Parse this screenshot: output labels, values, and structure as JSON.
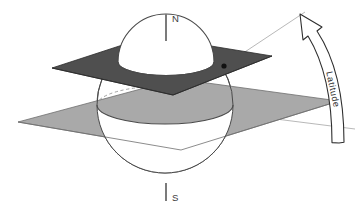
{
  "figure": {
    "background_color": "#ffffff"
  },
  "labels": {
    "north_pole": "N",
    "south_pole": "S",
    "latitude_arrow": "Latitude"
  },
  "colors": {
    "upper_plane": "#4f4f4f",
    "upper_plane_edge": "#2b2b2b",
    "lower_plane": "#a9a9a9",
    "lower_plane_edge": "#6f6f6f",
    "sphere_fill": "#ffffff",
    "sphere_outline": "#4a4a4a",
    "hidden_edge": "#8a8a8a",
    "axis": "#7b7b7b",
    "ray": "#9a9a9a",
    "point_marker": "#111111",
    "arrow_stroke": "#2e2e2e",
    "arrow_fill": "#ffffff"
  },
  "geometry": {
    "sphere_center": {
      "x": 165,
      "y": 105
    },
    "sphere_radius": 68,
    "equator_plane_y": 105,
    "latitude_plane_y": 62,
    "point_marker": {
      "x": 224,
      "y": 66
    },
    "axis_top": {
      "x": 166,
      "y": 14
    },
    "axis_bottom": {
      "x": 166,
      "y": 196
    }
  },
  "elements": [
    {
      "name": "upper-latitude-plane",
      "description": "Dark gray horizontal plane cutting the sphere above the equator"
    },
    {
      "name": "lower-equatorial-plane",
      "description": "Light gray horizontal equatorial plane through the sphere center"
    },
    {
      "name": "sphere",
      "description": "Globe with visible cap above the latitude plane"
    },
    {
      "name": "polar-axis",
      "description": "Vertical rotation axis from N to S pole"
    },
    {
      "name": "latitude-ray",
      "description": "Thin line from sphere center out through the surface point"
    },
    {
      "name": "equatorial-ray",
      "description": "Thin horizontal reference line from sphere center to the right"
    },
    {
      "name": "latitude-angle-arrow",
      "description": "Curved double-edged arrow sweeping from the equatorial ray up to the latitude ray"
    }
  ]
}
